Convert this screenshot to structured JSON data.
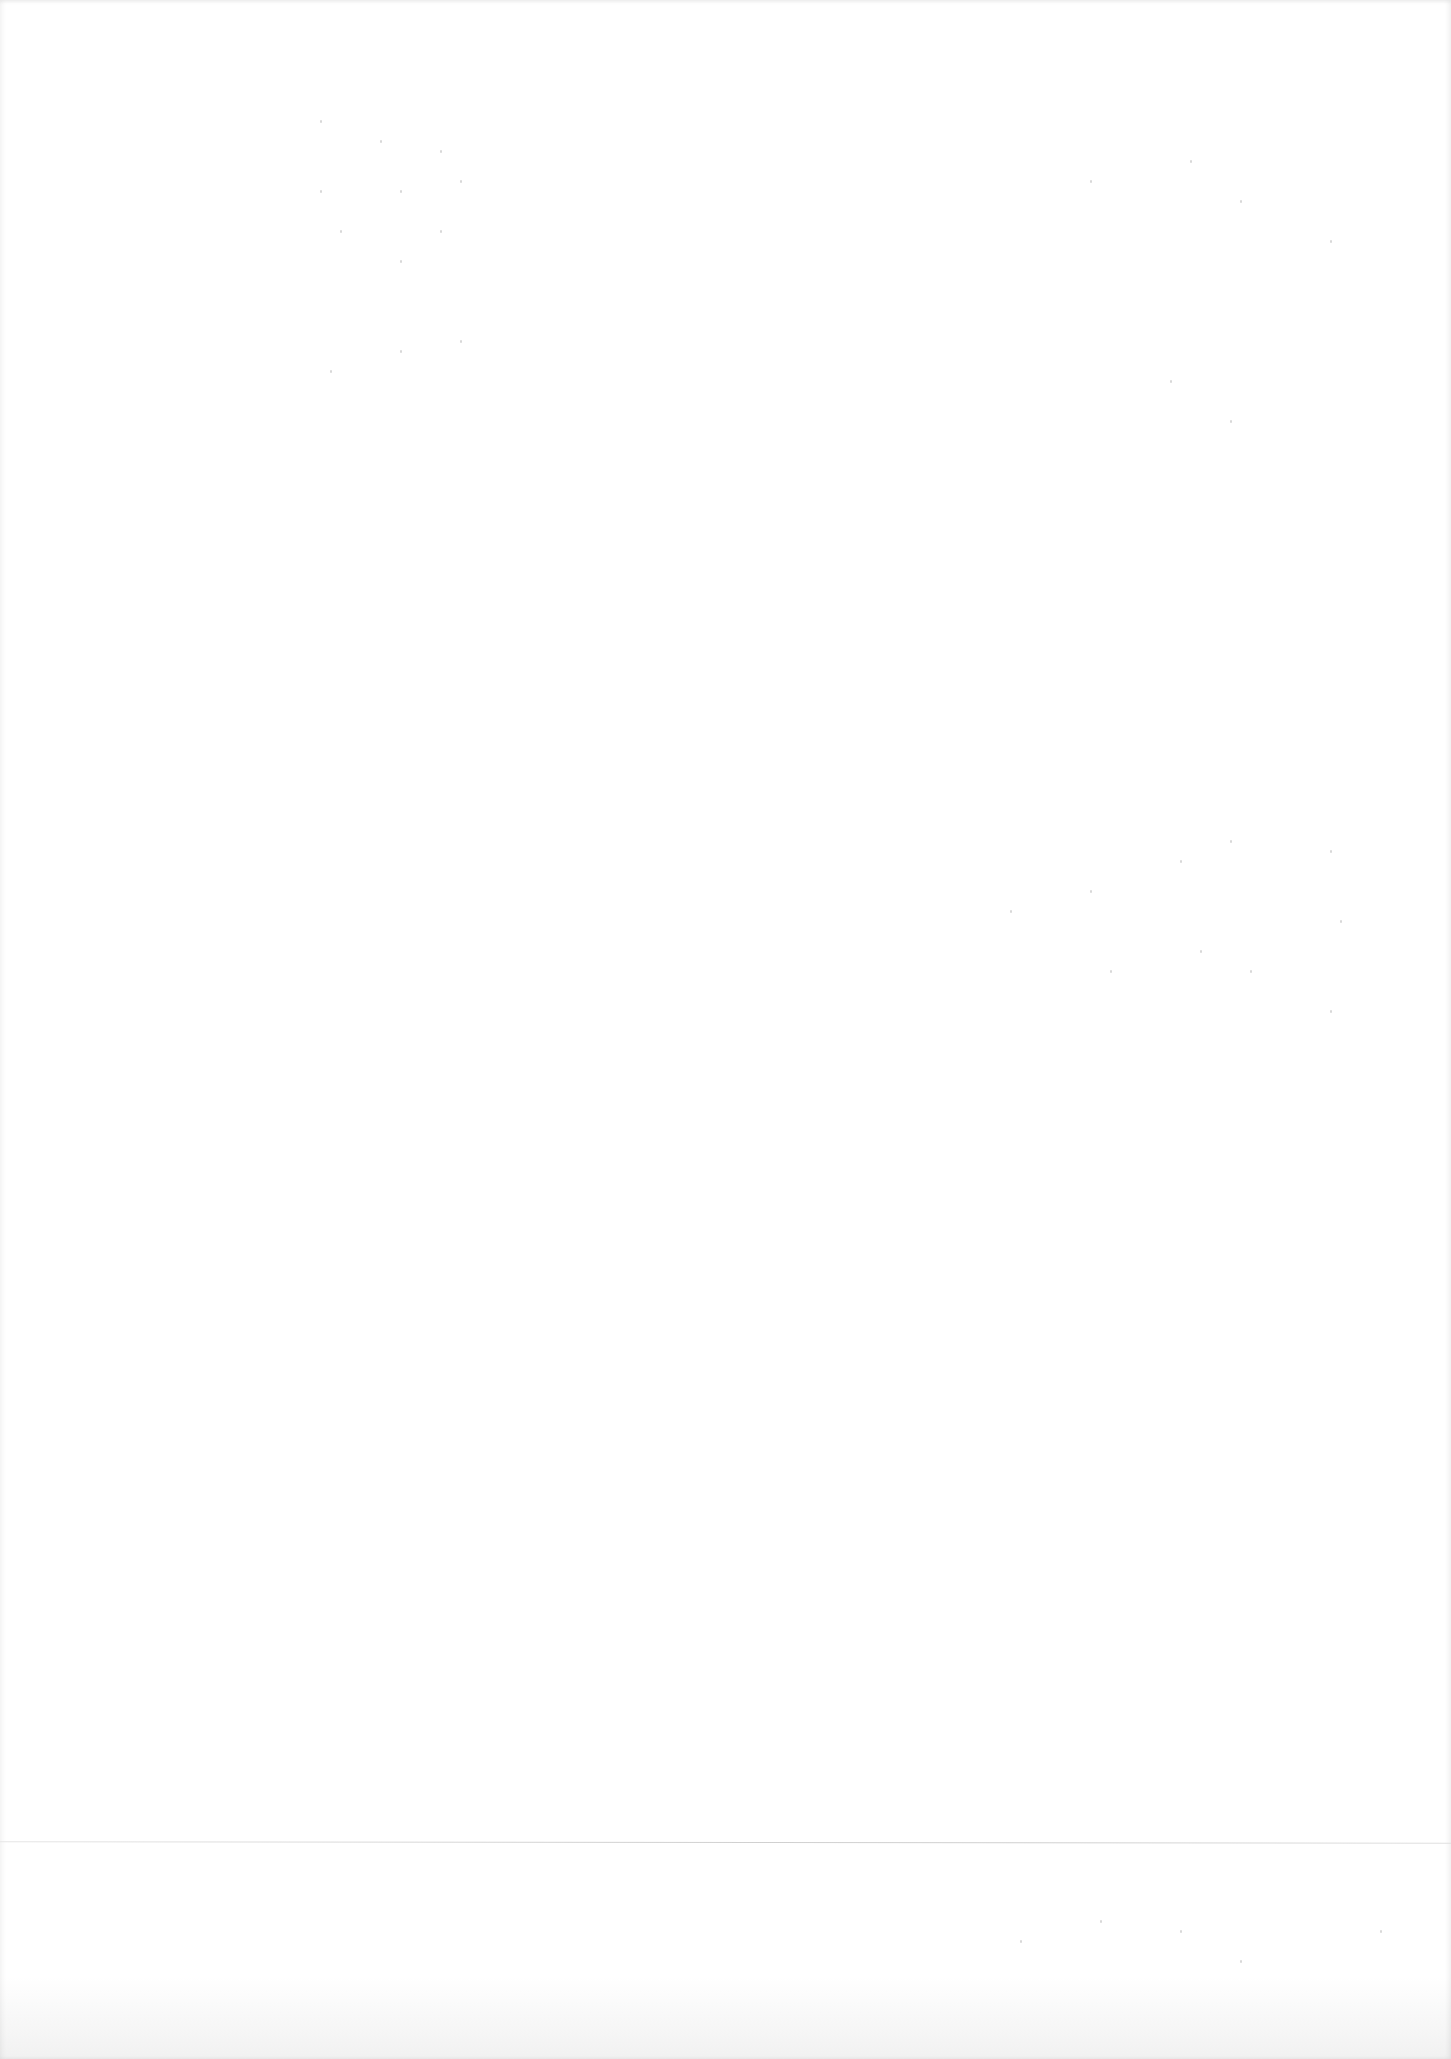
{
  "document": {
    "type": "blank scanned page",
    "visible_text": "",
    "background_color": "#ffffff",
    "fold_line_color": "#d2d2d2"
  }
}
